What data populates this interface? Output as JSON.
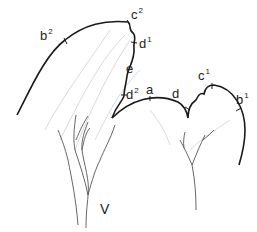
{
  "figure": {
    "type": "botanical-outline-diagram",
    "labels": [
      {
        "id": "b2",
        "base": "b",
        "sup": "2",
        "x": 40,
        "y": 28
      },
      {
        "id": "c2",
        "base": "c",
        "sup": "2",
        "x": 130,
        "y": 7
      },
      {
        "id": "d1",
        "base": "d",
        "sup": "1",
        "x": 140,
        "y": 38
      },
      {
        "id": "e",
        "base": "e",
        "sup": "",
        "x": 128,
        "y": 64
      },
      {
        "id": "d2",
        "base": "d",
        "sup": "2",
        "x": 124,
        "y": 88
      },
      {
        "id": "a",
        "base": "a",
        "sup": "",
        "x": 146,
        "y": 86
      },
      {
        "id": "d",
        "base": "d",
        "sup": "",
        "x": 171,
        "y": 88
      },
      {
        "id": "c1",
        "base": "c",
        "sup": "1",
        "x": 196,
        "y": 70
      },
      {
        "id": "b1",
        "base": "b",
        "sup": "1",
        "x": 235,
        "y": 94
      },
      {
        "id": "V",
        "base": "V",
        "sup": "",
        "x": 99,
        "y": 203
      }
    ],
    "colors": {
      "outline": "#1a1a1a",
      "veins": "#555555",
      "faint": "#c8c8c8"
    }
  }
}
